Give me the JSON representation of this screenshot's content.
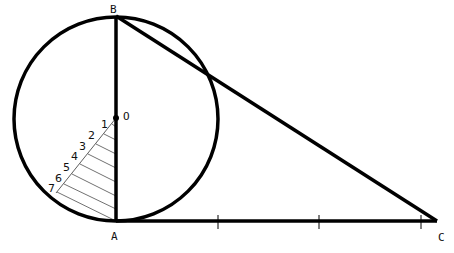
{
  "diagram": {
    "points": {
      "A": {
        "label": "A",
        "x": 116,
        "y": 221
      },
      "B": {
        "label": "B",
        "x": 116,
        "y": 16
      },
      "C": {
        "label": "C",
        "x": 437,
        "y": 221
      },
      "O": {
        "label": "O",
        "x": 116,
        "y": 118
      }
    },
    "circle": {
      "cx": 116,
      "cy": 119,
      "r": 102
    },
    "ticks_on_AC": [
      218,
      319,
      421
    ],
    "hatch_numbers": [
      "1",
      "2",
      "3",
      "4",
      "5",
      "6",
      "7"
    ],
    "colors": {
      "stroke": "#000000",
      "background": "#ffffff"
    }
  }
}
